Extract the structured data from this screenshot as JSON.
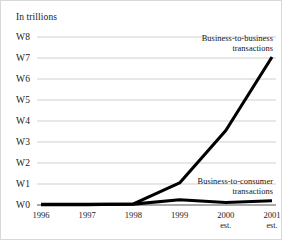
{
  "figure": {
    "unit_label": "In trillions",
    "background_color": "#ffffff",
    "border_color": "#d8d8d8",
    "line_color": "#000000",
    "grid_color": "#c9c9c9",
    "axis_color": "#555555"
  },
  "annotations": {
    "b2b_line1": "Business-to-business",
    "b2b_line2": "transactions",
    "b2c_line1": "Business-to-consumer",
    "b2c_line2": "transactions"
  },
  "axes": {
    "y_ticks": [
      "W0",
      "W1",
      "W2",
      "W3",
      "W4",
      "W5",
      "W6",
      "W7",
      "W8"
    ],
    "x_ticks": [
      {
        "year": "1996",
        "est": ""
      },
      {
        "year": "1997",
        "est": ""
      },
      {
        "year": "1998",
        "est": ""
      },
      {
        "year": "1999",
        "est": ""
      },
      {
        "year": "2000",
        "est": "est."
      },
      {
        "year": "2001",
        "est": "est."
      }
    ]
  },
  "chart_data": {
    "type": "line",
    "title": "",
    "subtitle": "",
    "xlabel": "",
    "ylabel": "In trillions",
    "x": [
      "1996",
      "1997",
      "1998",
      "1999",
      "2000 est.",
      "2001 est."
    ],
    "xlim": [
      0,
      5
    ],
    "ylim": [
      0,
      8
    ],
    "y_tick_values": [
      0,
      1,
      2,
      3,
      4,
      5,
      6,
      7,
      8
    ],
    "y_tick_labels": [
      "W0",
      "W1",
      "W2",
      "W3",
      "W4",
      "W5",
      "W6",
      "W7",
      "W8"
    ],
    "grid": "horizontal",
    "legend": "annotations-inline",
    "series": [
      {
        "name": "Business-to-business transactions",
        "values": [
          0.02,
          0.02,
          0.05,
          1.05,
          3.55,
          7.05
        ],
        "color": "#000000"
      },
      {
        "name": "Business-to-consumer transactions",
        "values": [
          0.03,
          0.03,
          0.04,
          0.25,
          0.12,
          0.2
        ],
        "color": "#000000"
      }
    ]
  }
}
